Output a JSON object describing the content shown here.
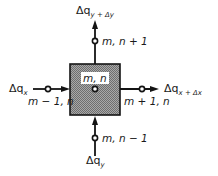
{
  "diagram": {
    "colors": {
      "line": "#141414",
      "cell_fill": "#8f8f8f",
      "background": "#ffffff"
    },
    "center_node": {
      "label": "m, n"
    },
    "nodes": {
      "top": {
        "label": "m, n + 1"
      },
      "bottom": {
        "label": "m, n − 1"
      },
      "left": {
        "label": "m − 1, n"
      },
      "right": {
        "label": "m + 1, n"
      }
    },
    "fluxes": {
      "top": {
        "symbol": "Δq",
        "subscript": "y + Δy"
      },
      "bottom": {
        "symbol": "Δq",
        "subscript": "y"
      },
      "left": {
        "symbol": "Δq",
        "subscript": "x"
      },
      "right": {
        "symbol": "Δq",
        "subscript": "x + Δx"
      }
    }
  }
}
